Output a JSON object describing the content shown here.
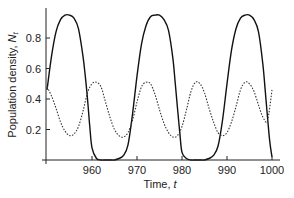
{
  "chart_data": {
    "type": "line",
    "title": "",
    "xlabel": "Time, t",
    "ylabel": "Population density, N_t",
    "xlabel_parts": {
      "text": "Time, ",
      "var": "t"
    },
    "ylabel_parts": {
      "text": "Population density, ",
      "var": "N",
      "sub": "t"
    },
    "xlim": [
      950,
      1001
    ],
    "ylim": [
      0,
      0.98
    ],
    "xticks": [
      960,
      970,
      980,
      990,
      1000
    ],
    "yticks": [
      0.2,
      0.4,
      0.6,
      0.8
    ],
    "ytick_labels": [
      "0.2",
      "0.4",
      "0.6",
      "0.8"
    ],
    "xtick_labels": [
      "960",
      "970",
      "980",
      "990",
      "1000"
    ],
    "grid": false,
    "legend": null,
    "series": [
      {
        "name": "solid",
        "style": "solid",
        "color": "#111111",
        "x": [
          950,
          951,
          952,
          953,
          954,
          955,
          956,
          957,
          958,
          958.5,
          959,
          959.5,
          960,
          961,
          962,
          963,
          964,
          965,
          966,
          967,
          968,
          969,
          970,
          971,
          972,
          973,
          974,
          975,
          976,
          977,
          978,
          978.5,
          979,
          979.5,
          980,
          981,
          982,
          983,
          984,
          985,
          986,
          987,
          988,
          989,
          990,
          991,
          992,
          993,
          994,
          995,
          996,
          997,
          998,
          998.5,
          999,
          999.5,
          1000
        ],
        "y": [
          0.46,
          0.68,
          0.84,
          0.92,
          0.95,
          0.95,
          0.93,
          0.86,
          0.68,
          0.55,
          0.4,
          0.22,
          0.08,
          0.01,
          0.0,
          0.0,
          0.0,
          0.0,
          0.01,
          0.03,
          0.1,
          0.3,
          0.55,
          0.76,
          0.88,
          0.94,
          0.95,
          0.95,
          0.92,
          0.85,
          0.66,
          0.5,
          0.34,
          0.18,
          0.05,
          0.01,
          0.0,
          0.0,
          0.0,
          0.0,
          0.01,
          0.03,
          0.09,
          0.26,
          0.5,
          0.72,
          0.86,
          0.93,
          0.95,
          0.95,
          0.92,
          0.84,
          0.62,
          0.45,
          0.28,
          0.12,
          0.02
        ]
      },
      {
        "name": "dotted",
        "style": "dotted",
        "color": "#333333",
        "x": [
          950,
          951,
          952,
          953,
          954,
          955,
          956,
          957,
          958,
          959,
          960,
          961,
          962,
          963,
          964,
          965,
          966,
          967,
          968,
          969,
          970,
          971,
          972,
          973,
          974,
          975,
          976,
          977,
          978,
          979,
          980,
          981,
          982,
          983,
          984,
          985,
          986,
          987,
          988,
          989,
          990,
          991,
          992,
          993,
          994,
          995,
          996,
          997,
          998,
          999,
          1000
        ],
        "y": [
          0.48,
          0.42,
          0.34,
          0.25,
          0.19,
          0.16,
          0.17,
          0.22,
          0.32,
          0.44,
          0.5,
          0.51,
          0.48,
          0.38,
          0.28,
          0.2,
          0.16,
          0.15,
          0.18,
          0.26,
          0.38,
          0.48,
          0.51,
          0.5,
          0.43,
          0.33,
          0.24,
          0.18,
          0.15,
          0.16,
          0.22,
          0.33,
          0.45,
          0.51,
          0.5,
          0.44,
          0.34,
          0.25,
          0.18,
          0.16,
          0.18,
          0.25,
          0.35,
          0.46,
          0.51,
          0.5,
          0.45,
          0.36,
          0.28,
          0.26,
          0.46
        ]
      }
    ]
  }
}
